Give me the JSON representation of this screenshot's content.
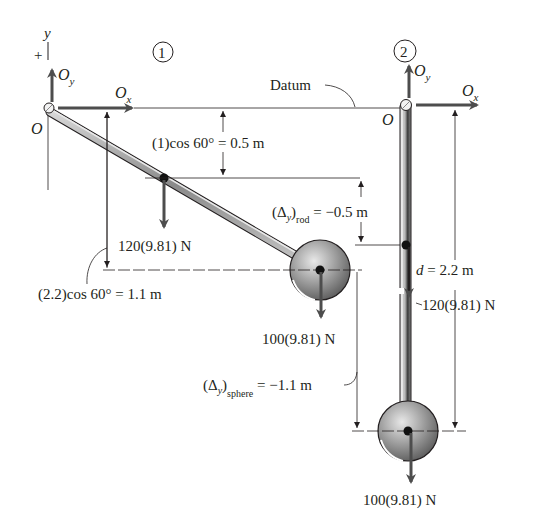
{
  "figure": {
    "config1": {
      "circle_label": "1",
      "y_axis_label": "y",
      "plus_sign": "+",
      "pivot_label": "O",
      "Oy_main": "O",
      "Oy_sub": "y",
      "Ox_main": "O",
      "Ox_sub": "x",
      "rod_height_dim": "(1)cos 60° = 0.5 m",
      "sphere_height_dim": "(2.2)cos 60° = 1.1 m",
      "rod_weight": "120(9.81) N",
      "sphere_weight": "100(9.81) N"
    },
    "config2": {
      "circle_label": "2",
      "datum_label": "Datum",
      "pivot_label": "O",
      "Oy_main": "O",
      "Oy_sub": "y",
      "Ox_main": "O",
      "Ox_sub": "x",
      "delta_rod_prefix": "(Δ",
      "delta_rod_y": "y",
      "delta_rod_close": ")",
      "delta_rod_sub": "rod",
      "delta_rod_value": " = −0.5 m",
      "length_d": "d",
      "length_value": " = 2.2 m",
      "rod_weight": "120(9.81) N",
      "delta_sphere_prefix": "(Δ",
      "delta_sphere_y": "y",
      "delta_sphere_close": ")",
      "delta_sphere_sub": "sphere",
      "delta_sphere_value": " = −1.1 m",
      "sphere_weight": "100(9.81) N"
    },
    "colors": {
      "line": "#231f20",
      "arrow": "#4d4d4d",
      "rod_fill": "#9a9a9a",
      "sphere_fill": "#8c8c8c"
    }
  }
}
